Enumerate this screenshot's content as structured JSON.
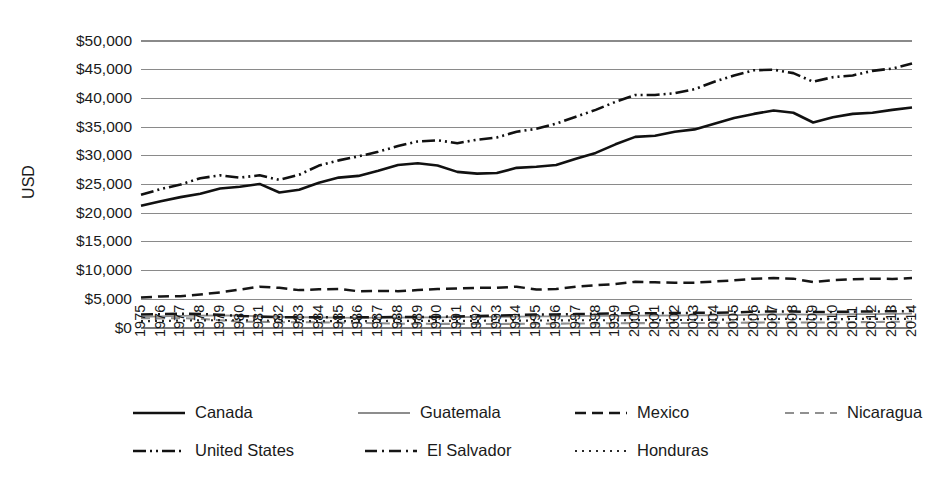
{
  "chart_data": {
    "type": "line",
    "title": "",
    "xlabel": "",
    "ylabel": "USD",
    "ylim": [
      0,
      50000
    ],
    "ytick_values": [
      0,
      5000,
      10000,
      15000,
      20000,
      25000,
      30000,
      35000,
      40000,
      45000,
      50000
    ],
    "ytick_labels": [
      "$0",
      "$5,000",
      "$10,000",
      "$15,000",
      "$20,000",
      "$25,000",
      "$30,000",
      "$35,000",
      "$40,000",
      "$45,000",
      "$50,000"
    ],
    "grid": true,
    "legend_position": "bottom",
    "x": [
      1975,
      1976,
      1977,
      1978,
      1979,
      1980,
      1981,
      1982,
      1983,
      1984,
      1985,
      1986,
      1987,
      1988,
      1989,
      1990,
      1991,
      1992,
      1993,
      1994,
      1995,
      1996,
      1997,
      1998,
      1999,
      2000,
      2001,
      2002,
      2003,
      2004,
      2005,
      2006,
      2007,
      2008,
      2009,
      2010,
      2011,
      2012,
      2013,
      2014
    ],
    "xtick_labels": [
      "1975",
      "1976",
      "1977",
      "1978",
      "1979",
      "1980",
      "1981",
      "1982",
      "1983",
      "1984",
      "1985",
      "1986",
      "1987",
      "1988",
      "1989",
      "1990",
      "1991",
      "1992",
      "1993",
      "1994",
      "1995",
      "1996",
      "1997",
      "1998",
      "1999",
      "2000",
      "2001",
      "2002",
      "2003",
      "2004",
      "2005",
      "2006",
      "2007",
      "2008",
      "2009",
      "2010",
      "2011",
      "2012",
      "2013",
      "2014"
    ],
    "series": [
      {
        "name": "Canada",
        "style": "solid",
        "color": "#111111",
        "width": 2.6,
        "dash": "none",
        "values": [
          21300,
          22100,
          22800,
          23400,
          24300,
          24600,
          25100,
          23600,
          24100,
          25300,
          26200,
          26500,
          27400,
          28400,
          28700,
          28300,
          27200,
          26900,
          27000,
          27900,
          28100,
          28400,
          29500,
          30500,
          32000,
          33300,
          33500,
          34200,
          34600,
          35600,
          36600,
          37300,
          37900,
          37500,
          35800,
          36700,
          37300,
          37500,
          38000,
          38400
        ]
      },
      {
        "name": "Guatemala",
        "style": "solid-thin",
        "color": "#8d8d8d",
        "width": 1.8,
        "dash": "none",
        "values": [
          1950,
          2020,
          2100,
          2150,
          2180,
          2150,
          2050,
          1940,
          1870,
          1860,
          1820,
          1780,
          1800,
          1820,
          1850,
          1860,
          1880,
          1920,
          1950,
          1970,
          2010,
          2020,
          2060,
          2100,
          2120,
          2140,
          2160,
          2180,
          2190,
          2220,
          2250,
          2300,
          2350,
          2360,
          2330,
          2360,
          2400,
          2430,
          2470,
          2510
        ]
      },
      {
        "name": "Mexico",
        "style": "dashed",
        "color": "#161616",
        "width": 2.5,
        "dash": "11,6",
        "values": [
          5300,
          5500,
          5550,
          5850,
          6200,
          6700,
          7200,
          7000,
          6600,
          6750,
          6800,
          6400,
          6450,
          6420,
          6600,
          6800,
          6900,
          7000,
          7000,
          7200,
          6700,
          6800,
          7200,
          7450,
          7650,
          8050,
          7950,
          7900,
          7900,
          8100,
          8300,
          8600,
          8700,
          8600,
          8000,
          8350,
          8500,
          8600,
          8550,
          8700
        ]
      },
      {
        "name": "Nicaragua",
        "style": "dashed-thin",
        "color": "#909090",
        "width": 2.1,
        "dash": "9,6",
        "values": [
          1700,
          1680,
          1720,
          1600,
          1350,
          1100,
          1080,
          1000,
          1020,
          980,
          940,
          880,
          850,
          760,
          740,
          720,
          710,
          710,
          700,
          720,
          740,
          760,
          780,
          800,
          830,
          850,
          860,
          860,
          870,
          890,
          910,
          940,
          960,
          970,
          950,
          970,
          1010,
          1050,
          1080,
          1110
        ]
      },
      {
        "name": "United States",
        "style": "dash-dot-dot",
        "color": "#111111",
        "width": 2.6,
        "dash": "13,4,2,4,2,4",
        "values": [
          23200,
          24200,
          25000,
          26100,
          26600,
          26200,
          26600,
          25800,
          26700,
          28300,
          29200,
          29900,
          30700,
          31700,
          32500,
          32700,
          32200,
          32800,
          33200,
          34200,
          34700,
          35600,
          36800,
          38000,
          39400,
          40600,
          40600,
          40900,
          41600,
          42900,
          44000,
          44900,
          45000,
          44400,
          42900,
          43700,
          44000,
          44800,
          45200,
          46100
        ]
      },
      {
        "name": "El Salvador",
        "style": "dash-dot",
        "color": "#161616",
        "width": 2.5,
        "dash": "12,5,2,5",
        "values": [
          2350,
          2420,
          2500,
          2450,
          2300,
          2100,
          1980,
          1880,
          1880,
          1880,
          1880,
          1860,
          1880,
          1900,
          1910,
          1960,
          2010,
          2080,
          2170,
          2260,
          2340,
          2360,
          2420,
          2490,
          2540,
          2570,
          2580,
          2610,
          2640,
          2670,
          2730,
          2820,
          2890,
          2890,
          2790,
          2810,
          2850,
          2880,
          2910,
          2950
        ]
      },
      {
        "name": "Honduras",
        "style": "dotted",
        "color": "#2a2a2a",
        "width": 2.2,
        "dash": "2,5",
        "values": [
          1200,
          1230,
          1290,
          1330,
          1360,
          1340,
          1300,
          1230,
          1210,
          1210,
          1210,
          1200,
          1220,
          1230,
          1230,
          1230,
          1230,
          1250,
          1290,
          1280,
          1310,
          1310,
          1340,
          1360,
          1340,
          1370,
          1380,
          1390,
          1400,
          1440,
          1480,
          1530,
          1570,
          1580,
          1530,
          1540,
          1570,
          1580,
          1590,
          1610
        ]
      }
    ],
    "legend": {
      "rows": [
        [
          {
            "name": "Canada",
            "style": "solid"
          },
          {
            "name": "Guatemala",
            "style": "solid-thin"
          },
          {
            "name": "Mexico",
            "style": "dashed"
          },
          {
            "name": "Nicaragua",
            "style": "dashed-thin"
          }
        ],
        [
          {
            "name": "United States",
            "style": "dash-dot-dot"
          },
          {
            "name": "El Salvador",
            "style": "dash-dot"
          },
          {
            "name": "Honduras",
            "style": "dotted"
          }
        ]
      ]
    }
  }
}
